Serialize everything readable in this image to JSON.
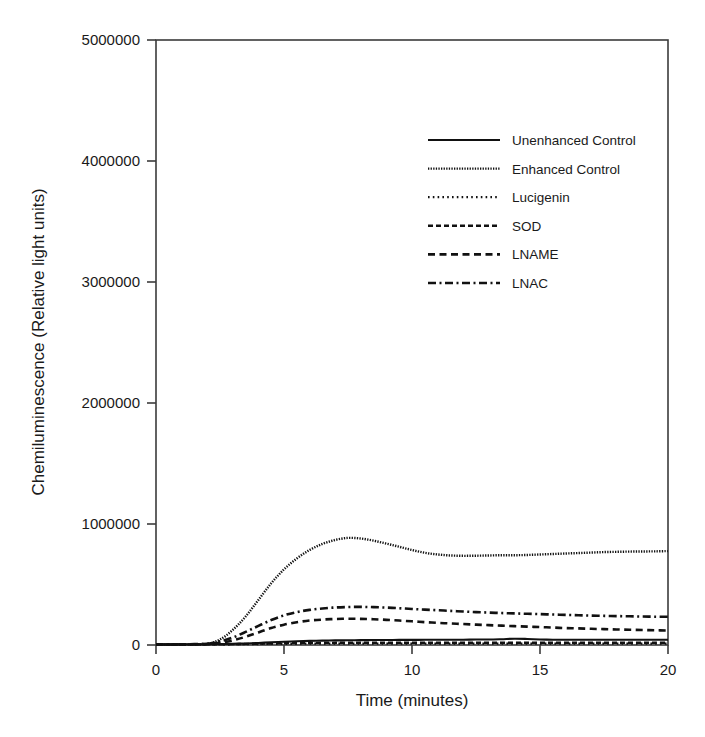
{
  "chart_data": {
    "type": "line",
    "title": "",
    "xlabel": "Time (minutes)",
    "ylabel": "Chemiluminescence (Relative light units)",
    "xlim": [
      0,
      20
    ],
    "ylim": [
      0,
      5000000
    ],
    "xticks": [
      0,
      5,
      10,
      15,
      20
    ],
    "xtick_labels": [
      "0",
      "5",
      "10",
      "15",
      "20"
    ],
    "yticks": [
      0,
      1000000,
      2000000,
      3000000,
      4000000,
      5000000
    ],
    "ytick_labels": [
      "0",
      "1000000",
      "2000000",
      "3000000",
      "4000000",
      "5000000"
    ],
    "grid": false,
    "legend_position": "upper-center",
    "x": [
      0,
      0.5,
      1,
      1.5,
      2,
      2.5,
      3,
      3.5,
      4,
      4.5,
      5,
      5.5,
      6,
      6.5,
      7,
      7.5,
      8,
      8.5,
      9,
      9.5,
      10,
      10.5,
      11,
      11.5,
      12,
      12.5,
      13,
      13.5,
      14,
      14.5,
      15,
      15.5,
      16,
      16.5,
      17,
      17.5,
      18,
      18.5,
      19,
      19.5,
      20
    ],
    "series": [
      {
        "name": "Unenhanced Control",
        "dash": "solid",
        "color": "#111111",
        "values": [
          5000,
          5000,
          6000,
          6000,
          7000,
          8000,
          10000,
          13000,
          17000,
          22000,
          27000,
          31000,
          34000,
          36000,
          38000,
          39000,
          40000,
          41000,
          41000,
          42000,
          42000,
          43000,
          43000,
          44000,
          44000,
          45000,
          45000,
          48000,
          52000,
          50000,
          46000,
          44000,
          43000,
          43000,
          43000,
          43000,
          43000,
          43000,
          43000,
          43000,
          43000
        ]
      },
      {
        "name": "Enhanced Control",
        "dash": "fine-dotted",
        "color": "#111111",
        "values": [
          3000,
          3000,
          4000,
          5000,
          8000,
          45000,
          125000,
          235000,
          372000,
          510000,
          625000,
          715000,
          785000,
          835000,
          868000,
          885000,
          880000,
          862000,
          838000,
          812000,
          785000,
          762000,
          748000,
          740000,
          737000,
          738000,
          740000,
          742000,
          742000,
          744000,
          748000,
          752000,
          756000,
          760000,
          764000,
          768000,
          770000,
          772000,
          773000,
          774000,
          776000
        ]
      },
      {
        "name": "Lucigenin",
        "dash": "dotted",
        "color": "#111111",
        "values": [
          3000,
          3000,
          3000,
          4000,
          4000,
          5000,
          6000,
          7000,
          8000,
          9000,
          10000,
          10000,
          11000,
          11000,
          12000,
          12000,
          12000,
          12000,
          12000,
          12000,
          12000,
          12000,
          12000,
          12000,
          12000,
          12000,
          12000,
          12000,
          12000,
          12000,
          12000,
          12000,
          12000,
          12000,
          12000,
          12000,
          12000,
          12000,
          12000,
          12000,
          12000
        ]
      },
      {
        "name": "SOD",
        "dash": "dashed-short",
        "color": "#111111",
        "values": [
          4000,
          4000,
          4000,
          5000,
          5000,
          6000,
          7000,
          9000,
          11000,
          13000,
          15000,
          16000,
          17000,
          18000,
          18000,
          19000,
          19000,
          19000,
          19000,
          19000,
          19000,
          19000,
          19000,
          19000,
          19000,
          19000,
          19000,
          19000,
          19000,
          19000,
          19000,
          19000,
          19000,
          19000,
          19000,
          19000,
          19000,
          19000,
          19000,
          19000,
          19000
        ]
      },
      {
        "name": "LNAME",
        "dash": "dashed-long",
        "color": "#111111",
        "values": [
          4000,
          4000,
          5000,
          6000,
          9000,
          18000,
          38000,
          68000,
          104000,
          140000,
          168000,
          188000,
          202000,
          210000,
          215000,
          217000,
          216000,
          213000,
          208000,
          202000,
          196000,
          189000,
          183000,
          178000,
          173000,
          168000,
          164000,
          160000,
          156000,
          152000,
          148000,
          144000,
          140000,
          137000,
          134000,
          131000,
          128000,
          126000,
          124000,
          122000,
          120000
        ]
      },
      {
        "name": "LNAC",
        "dash": "dash-dot",
        "color": "#111111",
        "values": [
          4000,
          4000,
          5000,
          7000,
          11000,
          30000,
          62000,
          108000,
          158000,
          206000,
          245000,
          272000,
          290000,
          302000,
          310000,
          314000,
          315000,
          313000,
          309000,
          304000,
          298000,
          292000,
          287000,
          282000,
          277000,
          272000,
          268000,
          264000,
          261000,
          258000,
          255000,
          252000,
          249000,
          246000,
          243000,
          241000,
          239000,
          237000,
          235000,
          234000,
          233000
        ]
      }
    ]
  },
  "legend": {
    "entries": [
      {
        "label": "Unenhanced Control"
      },
      {
        "label": "Enhanced Control"
      },
      {
        "label": "Lucigenin"
      },
      {
        "label": "SOD"
      },
      {
        "label": "LNAME"
      },
      {
        "label": "LNAC"
      }
    ]
  },
  "colors": {
    "ink": "#111111",
    "frame": "#3b3b3b",
    "background": "#ffffff"
  }
}
